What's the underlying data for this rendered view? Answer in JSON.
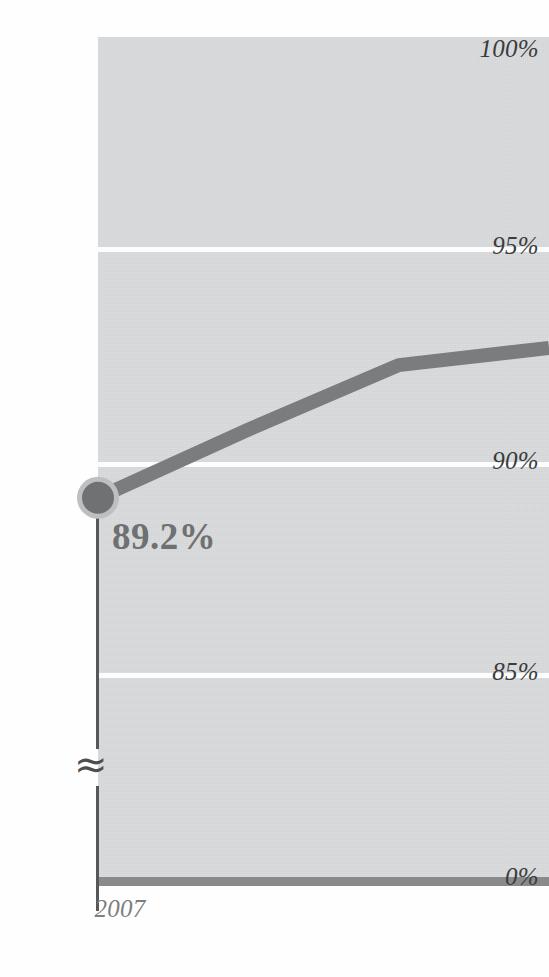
{
  "chart_data": {
    "type": "line",
    "title": "",
    "xlabel": "",
    "ylabel": "",
    "ylim": [
      0,
      100
    ],
    "grid": true,
    "axis_break": true,
    "axis_break_symbol": "≈",
    "legend_position": "none",
    "y_ticks": [
      "100%",
      "95%",
      "90%",
      "85%",
      "0%"
    ],
    "y_tick_values": [
      100,
      95,
      90,
      85,
      0
    ],
    "x_ticks": [
      "2007"
    ],
    "x_tick_values": [
      2007
    ],
    "series": [
      {
        "name": "Value",
        "x": [
          2007,
          2008,
          2009,
          2010
        ],
        "values": [
          89.2,
          90.8,
          92.3,
          92.7
        ],
        "color": "#7a7c7e",
        "marked_point": {
          "x": 2007,
          "value": 89.2,
          "label": "89.2%"
        }
      }
    ],
    "annotations": [
      {
        "text": "89.2%",
        "x": 2007,
        "y": 89.2,
        "position": "below-right"
      }
    ]
  },
  "axis": {
    "y_tick_100": "100%",
    "y_tick_95": "95%",
    "y_tick_90": "90%",
    "y_tick_85": "85%",
    "y_tick_0": "0%",
    "break_symbol_upper": "≈",
    "break_symbol_lower": "≈",
    "x_tick_2007": "2007"
  },
  "labels": {
    "data_point_value": "89.2%"
  },
  "colors": {
    "plot_background": "#d9dadb",
    "gridline": "#fdfdfd",
    "series_line": "#7a7c7e",
    "marker_fill": "#6f7173",
    "marker_halo": "#bdbfc1",
    "baseline": "#8a8a8a",
    "axis_line": "#555759",
    "tick_text": "#3a3c3e",
    "x_tick_text": "#7c7e80",
    "data_label_text": "#6e7072"
  },
  "page": {
    "clipped_title": ""
  }
}
